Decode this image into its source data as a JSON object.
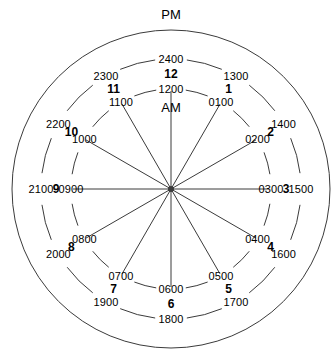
{
  "figure": {
    "title_top": "PM",
    "title_inner": "AM",
    "center": {
      "x": 171,
      "y": 189
    },
    "radii": {
      "outer": 159,
      "middle": 130,
      "inner": 100,
      "hub": 3
    },
    "colors": {
      "stroke": "#3b3b3b",
      "text": "#000000",
      "background": "#ffffff"
    }
  },
  "rings": {
    "outer_ring_label": "outer-boundary-circle",
    "middle_ring_label": "24-hour-ring",
    "inner_ring_label": "12-hour-ring"
  },
  "hours": [
    {
      "hour": "12",
      "am": "1200",
      "pm": "2400",
      "angle": 0
    },
    {
      "hour": "1",
      "am": "0100",
      "pm": "1300",
      "angle": 30
    },
    {
      "hour": "2",
      "am": "0200",
      "pm": "1400",
      "angle": 60
    },
    {
      "hour": "3",
      "am": "0300",
      "pm": "1500",
      "angle": 90
    },
    {
      "hour": "4",
      "am": "0400",
      "pm": "1600",
      "angle": 120
    },
    {
      "hour": "5",
      "am": "0500",
      "pm": "1700",
      "angle": 150
    },
    {
      "hour": "6",
      "am": "0600",
      "pm": "1800",
      "angle": 180
    },
    {
      "hour": "7",
      "am": "0700",
      "pm": "1900",
      "angle": 210
    },
    {
      "hour": "8",
      "am": "0800",
      "pm": "2000",
      "angle": 240
    },
    {
      "hour": "9",
      "am": "0900",
      "pm": "2100",
      "angle": 270
    },
    {
      "hour": "10",
      "am": "1000",
      "pm": "2200",
      "angle": 300
    },
    {
      "hour": "11",
      "am": "1100",
      "pm": "2300",
      "angle": 330
    }
  ],
  "chart_data": {
    "type": "pie",
    "categories": [
      "12",
      "1",
      "2",
      "3",
      "4",
      "5",
      "6",
      "7",
      "8",
      "9",
      "10",
      "11"
    ],
    "series": [
      {
        "name": "AM",
        "values": [
          "1200",
          "0100",
          "0200",
          "0300",
          "0400",
          "0500",
          "0600",
          "0700",
          "0800",
          "0900",
          "1000",
          "1100"
        ]
      },
      {
        "name": "PM",
        "values": [
          "2400",
          "1300",
          "1400",
          "1500",
          "1600",
          "1700",
          "1800",
          "1900",
          "2000",
          "2100",
          "2200",
          "2300"
        ]
      }
    ],
    "legend": [
      "AM",
      "PM"
    ],
    "legend_position": "inner-center (AM), top-outside (PM)",
    "grid": false,
    "annotations": [
      "PM",
      "AM"
    ]
  }
}
